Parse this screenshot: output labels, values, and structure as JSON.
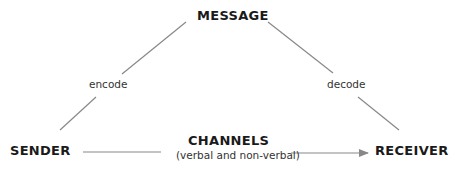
{
  "diagram": {
    "nodes": {
      "message": "MESSAGE",
      "sender": "SENDER",
      "receiver": "RECEIVER",
      "channels": "CHANNELS",
      "channels_sub": "(verbal and non-verbal)"
    },
    "edges": [
      {
        "from": "sender",
        "to": "message",
        "label": "encode"
      },
      {
        "from": "message",
        "to": "receiver",
        "label": "decode"
      },
      {
        "from": "sender",
        "to": "receiver",
        "label": "CHANNELS (verbal and non-verbal)",
        "arrow": true
      }
    ],
    "labels": {
      "encode": "encode",
      "decode": "decode"
    },
    "colors": {
      "text": "#1a1a1a",
      "line": "#888888"
    }
  }
}
